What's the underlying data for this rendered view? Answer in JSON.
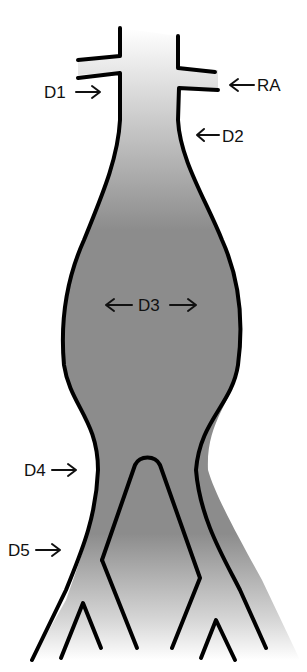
{
  "diagram": {
    "colors": {
      "vessel_fill": "#8c8c8c",
      "wall": "#000000",
      "background": "#ffffff"
    },
    "labels": {
      "d1": "D1",
      "ra": "RA",
      "d2": "D2",
      "d3": "D3",
      "d4": "D4",
      "d5": "D5"
    }
  }
}
